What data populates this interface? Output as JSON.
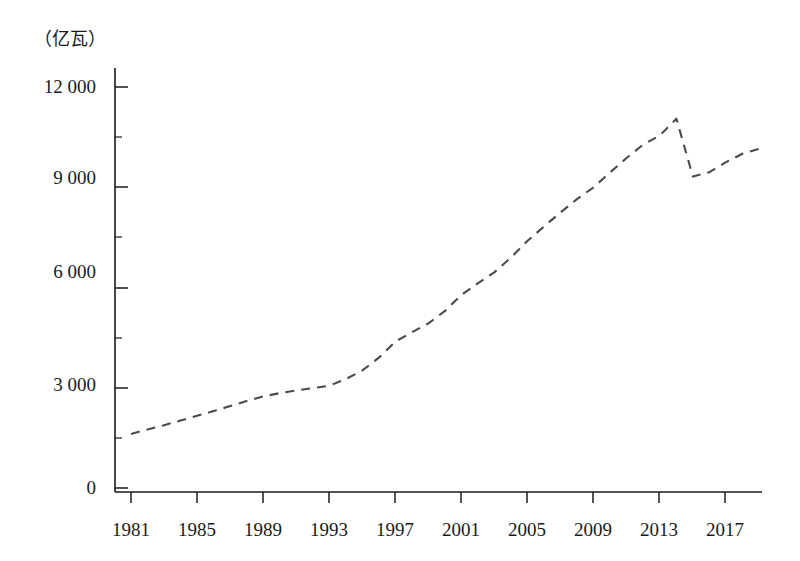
{
  "chart_data": {
    "type": "line",
    "title": "",
    "subtitle": "",
    "xlabel": "",
    "ylabel": "",
    "unit_label": "（亿瓦）",
    "series_name": "installed capacity",
    "line_style": "dashed",
    "line_color": "#4a4a4a",
    "grid": false,
    "legend": false,
    "xlim": [
      1981,
      2019
    ],
    "ylim": [
      0,
      12000
    ],
    "x_tick_labels": [
      "1981",
      "1985",
      "1989",
      "1993",
      "1997",
      "2001",
      "2005",
      "2009",
      "2013",
      "2017"
    ],
    "x_tick_values": [
      1981,
      1985,
      1989,
      1993,
      1997,
      2001,
      2005,
      2009,
      2013,
      2017
    ],
    "y_tick_labels": [
      "0",
      "3 000",
      "6 000",
      "9 000",
      "12 000"
    ],
    "y_tick_values": [
      0,
      3000,
      6000,
      9000,
      12000
    ],
    "y_minor_tick_values": [
      1500,
      4500,
      7500,
      10500
    ],
    "x": [
      1981,
      1982,
      1983,
      1984,
      1985,
      1986,
      1987,
      1988,
      1989,
      1990,
      1991,
      1992,
      1993,
      1994,
      1995,
      1996,
      1997,
      1998,
      1999,
      2000,
      2001,
      2002,
      2003,
      2004,
      2005,
      2006,
      2007,
      2008,
      2009,
      2010,
      2011,
      2012,
      2013,
      2014,
      2015,
      2016,
      2017,
      2018,
      2019
    ],
    "values": [
      1620,
      1750,
      1880,
      2020,
      2160,
      2300,
      2450,
      2600,
      2740,
      2840,
      2920,
      2990,
      3060,
      3260,
      3520,
      3900,
      4380,
      4660,
      4930,
      5300,
      5780,
      6130,
      6460,
      6900,
      7400,
      7830,
      8250,
      8650,
      9000,
      9450,
      9880,
      10280,
      10550,
      11050,
      9320,
      9450,
      9750,
      10000,
      10150
    ]
  }
}
